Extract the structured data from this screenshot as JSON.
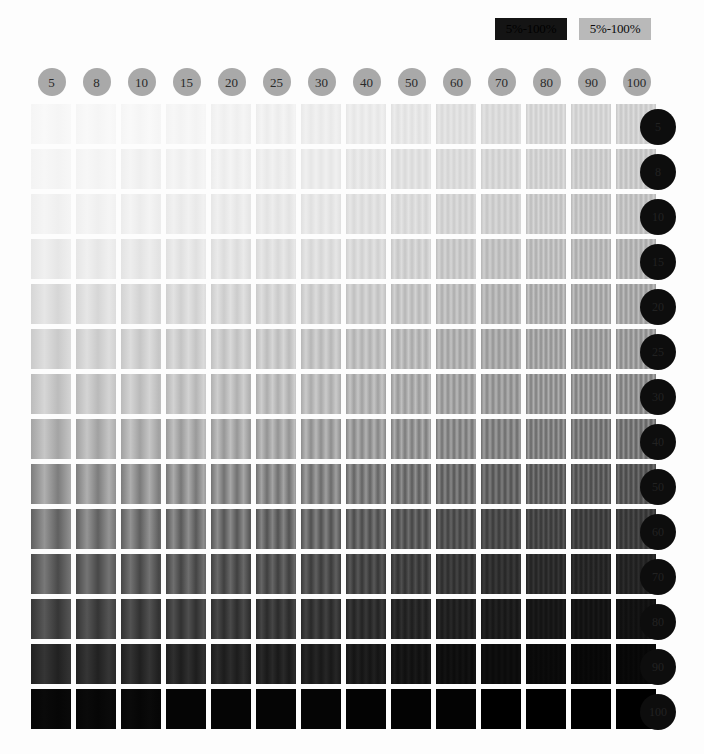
{
  "legend": {
    "items": [
      {
        "label": "5%-100%",
        "style": "dark",
        "bg": "#141414",
        "fg": "#000000"
      },
      {
        "label": "5%-100%",
        "style": "light",
        "bg": "#b9b9b9",
        "fg": "#0b0b0b"
      }
    ]
  },
  "chart_data": {
    "type": "heatmap",
    "title": "",
    "xlabel": "",
    "ylabel": "",
    "grid": false,
    "legend_position": "top-right",
    "column_header_color": "#a9a9a9",
    "row_header_color": "#0d0d0d",
    "categories": [
      "5",
      "8",
      "10",
      "15",
      "20",
      "25",
      "30",
      "40",
      "50",
      "60",
      "70",
      "80",
      "90",
      "100"
    ],
    "rows": [
      "5",
      "8",
      "10",
      "15",
      "20",
      "25",
      "30",
      "40",
      "50",
      "60",
      "70",
      "80",
      "90",
      "100"
    ],
    "x": [
      5,
      8,
      10,
      15,
      20,
      25,
      30,
      40,
      50,
      60,
      70,
      80,
      90,
      100
    ],
    "y": [
      5,
      8,
      10,
      15,
      20,
      25,
      30,
      40,
      50,
      60,
      70,
      80,
      90,
      100
    ],
    "xlim": [
      5,
      100
    ],
    "ylim": [
      5,
      100
    ],
    "values": [
      [
        3,
        3,
        3,
        4,
        5,
        6,
        7,
        8,
        10,
        12,
        14,
        16,
        17,
        18
      ],
      [
        4,
        4,
        5,
        5,
        6,
        7,
        8,
        10,
        12,
        14,
        16,
        18,
        20,
        21
      ],
      [
        5,
        5,
        6,
        7,
        8,
        9,
        10,
        12,
        14,
        17,
        19,
        21,
        23,
        24
      ],
      [
        8,
        8,
        9,
        10,
        11,
        12,
        13,
        15,
        18,
        21,
        24,
        26,
        28,
        29
      ],
      [
        13,
        13,
        14,
        15,
        16,
        17,
        18,
        20,
        23,
        26,
        29,
        31,
        33,
        34
      ],
      [
        17,
        17,
        18,
        19,
        20,
        21,
        23,
        25,
        28,
        31,
        34,
        36,
        38,
        39
      ],
      [
        21,
        22,
        22,
        23,
        25,
        26,
        27,
        30,
        33,
        36,
        39,
        41,
        43,
        44
      ],
      [
        29,
        30,
        30,
        32,
        33,
        34,
        36,
        39,
        42,
        45,
        48,
        50,
        52,
        53
      ],
      [
        41,
        41,
        42,
        43,
        45,
        46,
        48,
        51,
        54,
        57,
        60,
        62,
        64,
        65
      ],
      [
        52,
        52,
        53,
        55,
        56,
        58,
        59,
        62,
        65,
        68,
        71,
        73,
        75,
        76
      ],
      [
        62,
        63,
        64,
        65,
        67,
        68,
        70,
        72,
        75,
        78,
        81,
        83,
        85,
        86
      ],
      [
        72,
        73,
        74,
        75,
        77,
        78,
        79,
        82,
        85,
        87,
        89,
        91,
        92,
        93
      ],
      [
        83,
        83,
        84,
        85,
        86,
        87,
        88,
        90,
        92,
        94,
        95,
        96,
        97,
        97
      ],
      [
        97,
        97,
        97,
        98,
        98,
        98,
        98,
        99,
        99,
        99,
        100,
        100,
        100,
        100
      ]
    ]
  }
}
